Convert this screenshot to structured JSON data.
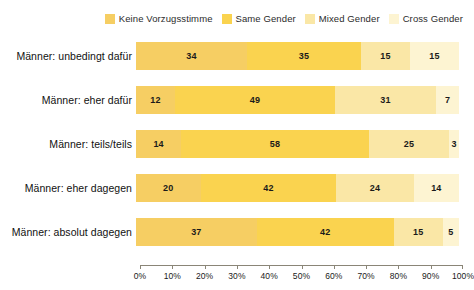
{
  "chart_data": {
    "type": "bar",
    "orientation": "horizontal",
    "stacked": true,
    "normalized_percent": true,
    "title": "",
    "subtitle": "",
    "xlabel": "",
    "ylabel": "",
    "xlim": [
      0,
      100
    ],
    "grid": false,
    "legend_position": "top-right",
    "categories": [
      "Männer: unbedingt dafür",
      "Männer: eher dafür",
      "Männer: teils/teils",
      "Männer: eher dagegen",
      "Männer: absolut dagegen"
    ],
    "series": [
      {
        "name": "Keine Vorzugsstimme",
        "color": "#f7d濃",
        "values": [
          34,
          12,
          14,
          20,
          37
        ]
      },
      {
        "name": "Same Gender",
        "values": [
          35,
          49,
          58,
          42,
          42
        ]
      },
      {
        "name": "Mixed Gender",
        "values": [
          15,
          31,
          25,
          24,
          15
        ]
      },
      {
        "name": "Cross Gender",
        "values": [
          15,
          7,
          3,
          14,
          5
        ]
      }
    ],
    "series_colors": [
      "#f6d濃",
      "#f9d34e",
      "#fae7a6",
      "#fdf4d2"
    ],
    "xticks": [
      0,
      10,
      20,
      30,
      40,
      50,
      60,
      70,
      80,
      90,
      100
    ],
    "xtick_labels": [
      "0%",
      "10%",
      "20%",
      "30%",
      "40%",
      "50%",
      "60%",
      "70%",
      "80%",
      "90%",
      "100%"
    ]
  },
  "legend": {
    "items": [
      {
        "label": "Keine Vorzugsstimme",
        "color": "#f6ce63"
      },
      {
        "label": "Same Gender",
        "color": "#fad34f"
      },
      {
        "label": "Mixed Gender",
        "color": "#fae7a6"
      },
      {
        "label": "Cross Gender",
        "color": "#fdf4d2"
      }
    ]
  },
  "rows": [
    {
      "label": "Männer: unbedingt dafür",
      "segments": [
        {
          "series": "Keine Vorzugsstimme",
          "value": 34,
          "display": "34",
          "color": "#f6ce63"
        },
        {
          "series": "Same Gender",
          "value": 35,
          "display": "35",
          "color": "#fad34f"
        },
        {
          "series": "Mixed Gender",
          "value": 15,
          "display": "15",
          "color": "#fae7a6"
        },
        {
          "series": "Cross Gender",
          "value": 15,
          "display": "15",
          "color": "#fdf4d2"
        }
      ]
    },
    {
      "label": "Männer: eher dafür",
      "segments": [
        {
          "series": "Keine Vorzugsstimme",
          "value": 12,
          "display": "12",
          "color": "#f6ce63"
        },
        {
          "series": "Same Gender",
          "value": 49,
          "display": "49",
          "color": "#fad34f"
        },
        {
          "series": "Mixed Gender",
          "value": 31,
          "display": "31",
          "color": "#fae7a6"
        },
        {
          "series": "Cross Gender",
          "value": 7,
          "display": "7",
          "color": "#fdf4d2"
        }
      ]
    },
    {
      "label": "Männer: teils/teils",
      "segments": [
        {
          "series": "Keine Vorzugsstimme",
          "value": 14,
          "display": "14",
          "color": "#f6ce63"
        },
        {
          "series": "Same Gender",
          "value": 58,
          "display": "58",
          "color": "#fad34f"
        },
        {
          "series": "Mixed Gender",
          "value": 25,
          "display": "25",
          "color": "#fae7a6"
        },
        {
          "series": "Cross Gender",
          "value": 3,
          "display": "3",
          "color": "#fdf4d2"
        }
      ]
    },
    {
      "label": "Männer: eher dagegen",
      "segments": [
        {
          "series": "Keine Vorzugsstimme",
          "value": 20,
          "display": "20",
          "color": "#f6ce63"
        },
        {
          "series": "Same Gender",
          "value": 42,
          "display": "42",
          "color": "#fad34f"
        },
        {
          "series": "Mixed Gender",
          "value": 24,
          "display": "24",
          "color": "#fae7a6"
        },
        {
          "series": "Cross Gender",
          "value": 14,
          "display": "14",
          "color": "#fdf4d2"
        }
      ]
    },
    {
      "label": "Männer: absolut dagegen",
      "segments": [
        {
          "series": "Keine Vorzugsstimme",
          "value": 37,
          "display": "37",
          "color": "#f6ce63"
        },
        {
          "series": "Same Gender",
          "value": 42,
          "display": "42",
          "color": "#fad34f"
        },
        {
          "series": "Mixed Gender",
          "value": 15,
          "display": "15",
          "color": "#fae7a6"
        },
        {
          "series": "Cross Gender",
          "value": 5,
          "display": "5",
          "color": "#fdf4d2"
        }
      ]
    }
  ],
  "axis": {
    "tick_labels": [
      "0%",
      "10%",
      "20%",
      "30%",
      "40%",
      "50%",
      "60%",
      "70%",
      "80%",
      "90%",
      "100%"
    ],
    "line_color": "#8a8577"
  }
}
